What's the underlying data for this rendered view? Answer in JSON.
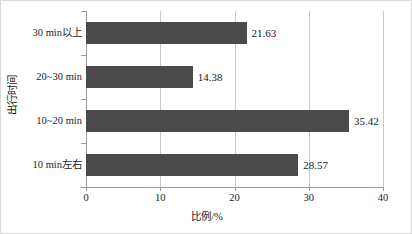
{
  "chart_data": {
    "type": "bar",
    "orientation": "horizontal",
    "title": "",
    "xlabel": "比例/%",
    "ylabel": "出行时间",
    "categories": [
      "10 min左右",
      "10~20 min",
      "20~30 min",
      "30 min以上"
    ],
    "values": [
      28.57,
      35.42,
      14.38,
      21.63
    ],
    "value_labels": [
      "28.57",
      "35.42",
      "14.38",
      "21.63"
    ],
    "xlim": [
      0,
      40
    ],
    "xticks": [
      0,
      10,
      20,
      30,
      40
    ],
    "xtick_labels": [
      "0",
      "10",
      "20",
      "30",
      "40"
    ],
    "grid": true,
    "grid_axis": "x",
    "legend": null,
    "bar_color": "#4a4a4a",
    "grid_color": "#c9c9c9",
    "axis_color": "#9a9a9a",
    "background_color": "#ffffff"
  }
}
